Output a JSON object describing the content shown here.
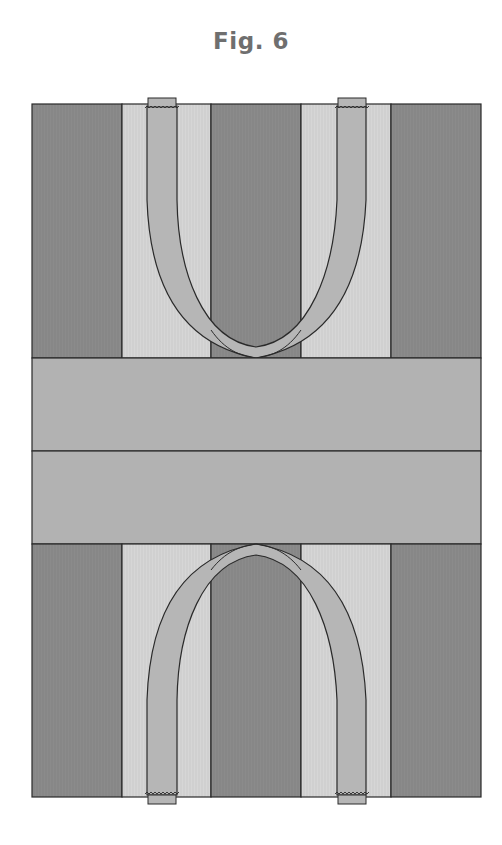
{
  "figure": {
    "title": "Fig. 6"
  },
  "colors": {
    "dark_strip": "#8b8b8b",
    "light_strip": "#d6d6d6",
    "band": "#b2b2b2",
    "strap": "#b6b6b6",
    "outline": "#2a2a2a"
  }
}
